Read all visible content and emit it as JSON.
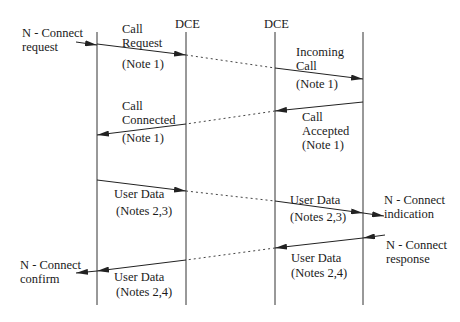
{
  "headers": {
    "dce_left": "DCE",
    "dce_right": "DCE"
  },
  "primitives": {
    "connect_request": [
      "N - Connect",
      "request"
    ],
    "connect_confirm": [
      "N - Connect",
      "confirm"
    ],
    "connect_indication": [
      "N - Connect",
      "indication"
    ],
    "connect_response": [
      "N - Connect",
      "response"
    ]
  },
  "messages": {
    "call_request": [
      "Call",
      "Request",
      "(Note  1)"
    ],
    "incoming_call": [
      "Incoming",
      "Call",
      "(Note  1)"
    ],
    "call_accepted": [
      "Call",
      "Accepted",
      "(Note  1)"
    ],
    "call_connected": [
      "Call",
      "Connected",
      "(Note  1)"
    ],
    "user_data_left_out": [
      "User  Data",
      "(Notes  2,3)"
    ],
    "user_data_right_in": [
      "User  Data",
      "(Notes  2,3)"
    ],
    "user_data_right_out": [
      "User  Data",
      "(Notes  2,4)"
    ],
    "user_data_left_in": [
      "User  Data",
      "(Notes  2,4)"
    ]
  },
  "colors": {
    "line": "#222222",
    "background": "#ffffff"
  }
}
